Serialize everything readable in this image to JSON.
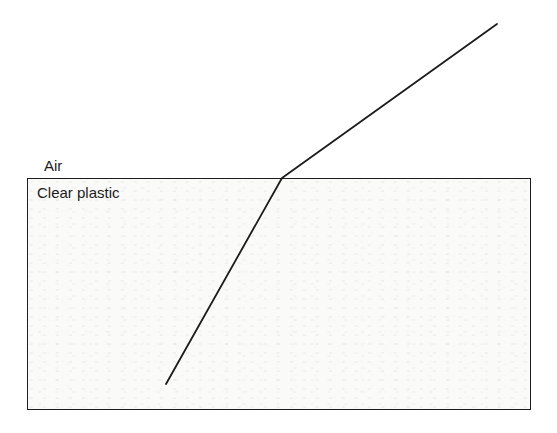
{
  "figure": {
    "air_label": "Air",
    "plastic_label": "Clear plastic",
    "ray": {
      "points": "497,24 282,178 166,384",
      "bend_point": "282,178"
    },
    "colors": {
      "ink": "#1c1c1c",
      "background": "#ffffff",
      "plastic_fill": "#fafaf9"
    }
  }
}
